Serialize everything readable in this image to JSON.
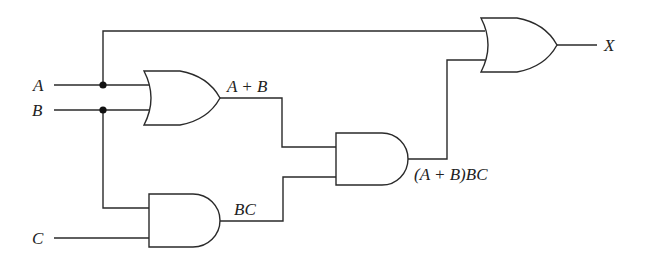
{
  "diagram": {
    "type": "logic-circuit",
    "inputs": [
      {
        "id": "A",
        "label": "A"
      },
      {
        "id": "B",
        "label": "B"
      },
      {
        "id": "C",
        "label": "C"
      }
    ],
    "gates": [
      {
        "id": "or1",
        "type": "OR",
        "inputs": [
          "A",
          "B"
        ],
        "output_label": "A + B"
      },
      {
        "id": "and1",
        "type": "AND",
        "inputs": [
          "B",
          "C"
        ],
        "output_label": "BC"
      },
      {
        "id": "and2",
        "type": "AND",
        "inputs": [
          "or1",
          "and1"
        ],
        "output_label": "(A + B)BC"
      },
      {
        "id": "or2",
        "type": "OR",
        "inputs": [
          "A",
          "and2"
        ],
        "output_label": "X"
      }
    ],
    "output": {
      "label": "X"
    },
    "colors": {
      "stroke": "#2a2a2a",
      "background": "#ffffff",
      "junction": "#111111"
    }
  }
}
